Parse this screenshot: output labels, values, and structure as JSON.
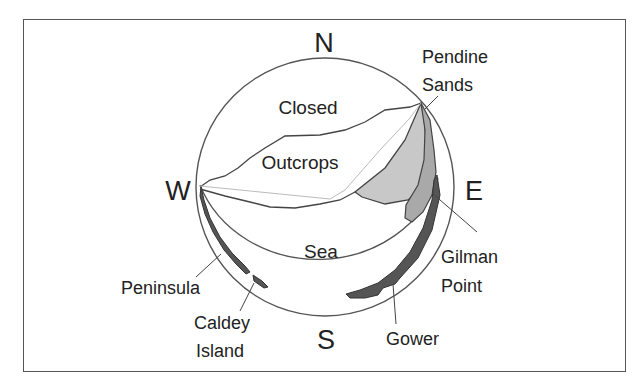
{
  "diagram": {
    "compass": {
      "north": "N",
      "east": "E",
      "south": "S",
      "west": "W"
    },
    "regions": {
      "closed": "Closed",
      "outcrops": "Outcrops",
      "sea": "Sea"
    },
    "places": {
      "pendine_sands": [
        "Pendine",
        "Sands"
      ],
      "gilman_point": [
        "Gilman",
        "Point"
      ],
      "gower": "Gower",
      "peninsula": "Peninsula",
      "caldey_island": [
        "Caldey",
        "Island"
      ]
    },
    "colors": {
      "frame": "#555555",
      "outline": "#444444",
      "light_fill": "#c8c8c8",
      "mid_fill": "#a9a9a9",
      "dark_fill": "#555555",
      "guide_line": "#bbbbbb",
      "text": "#222222"
    }
  }
}
